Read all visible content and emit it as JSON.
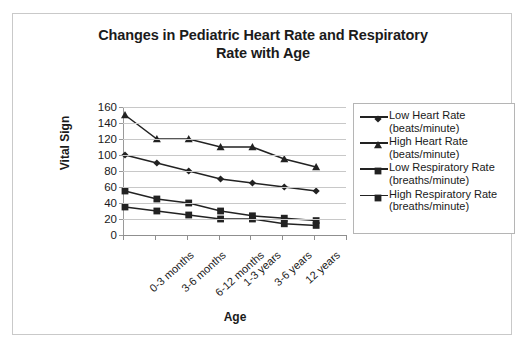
{
  "chart_data": {
    "type": "line",
    "title": "Changes in Pediatric Heart Rate and Respiratory Rate with Age",
    "title_line1": "Changes in Pediatric Heart Rate and Respiratory",
    "title_line2": "Rate with Age",
    "xlabel": "Age",
    "ylabel": "Vital Sign",
    "categories": [
      "0-3 months",
      "3-6 months",
      "6-12 months",
      "1-3 years",
      "3-6 years",
      "12 years",
      ""
    ],
    "ylim": [
      0,
      160
    ],
    "ytick_step": 20,
    "yticks": [
      "160",
      "140",
      "120",
      "100",
      "80",
      "60",
      "40",
      "20",
      "0"
    ],
    "grid": true,
    "legend_position": "right",
    "series": [
      {
        "name": "Low Heart Rate (beats/minute)",
        "label_line1": " Low Heart Rate",
        "label_line2": "(beats/minute)",
        "marker": "diamond",
        "color": "#222222",
        "values": [
          100,
          90,
          80,
          70,
          65,
          60,
          55
        ]
      },
      {
        "name": "High Heart Rate (beats/minute)",
        "label_line1": "High Heart Rate",
        "label_line2": "(beats/minute)",
        "marker": "triangle",
        "color": "#222222",
        "values": [
          150,
          120,
          120,
          110,
          110,
          95,
          85
        ]
      },
      {
        "name": "Low Respiratory Rate (breaths/minute)",
        "label_line1": "Low Respiratory Rate",
        "label_line2": "(breaths/minute)",
        "marker": "square",
        "color": "#222222",
        "values": [
          55,
          45,
          40,
          30,
          24,
          21,
          18
        ]
      },
      {
        "name": "High Respiratory Rate (breaths/minute)",
        "label_line1": "High Respiratory Rate",
        "label_line2": "(breaths/minute)",
        "marker": "square",
        "color": "#222222",
        "values": [
          35,
          30,
          25,
          20,
          20,
          14,
          12
        ]
      }
    ]
  }
}
